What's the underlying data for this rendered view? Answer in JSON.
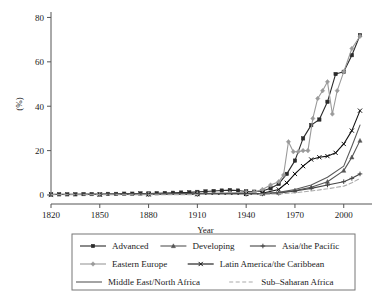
{
  "chart_data": {
    "type": "line",
    "title": "",
    "subtitle": "",
    "xlabel": "Year",
    "ylabel": "(%)",
    "xlim": [
      1820,
      2010
    ],
    "ylim": [
      0,
      82
    ],
    "grid": false,
    "legend_position": "bottom",
    "xticks": [
      1820,
      1850,
      1880,
      1910,
      1940,
      1970,
      2000
    ],
    "xticklabels": [
      "1820",
      "1850",
      "1880",
      "1910",
      "1940",
      "1970",
      "2000"
    ],
    "yticks": [
      0,
      20,
      40,
      60,
      80
    ],
    "yticklabels": [
      "0",
      "20",
      "40",
      "60",
      "80"
    ],
    "series": [
      {
        "name": "Advanced",
        "marker": "square",
        "color": "#2b2b2b",
        "dash": "none",
        "x": [
          1820,
          1825,
          1830,
          1835,
          1840,
          1845,
          1850,
          1855,
          1860,
          1865,
          1870,
          1875,
          1880,
          1885,
          1890,
          1895,
          1900,
          1905,
          1910,
          1915,
          1920,
          1925,
          1930,
          1935,
          1940,
          1945,
          1950,
          1955,
          1960,
          1965,
          1970,
          1975,
          1980,
          1985,
          1990,
          1995,
          2000,
          2005,
          2010
        ],
        "values": [
          0.3,
          0.3,
          0.3,
          0.3,
          0.4,
          0.4,
          0.4,
          0.5,
          0.5,
          0.6,
          0.6,
          0.7,
          0.7,
          0.8,
          0.9,
          1.0,
          1.1,
          1.2,
          1.4,
          1.6,
          1.8,
          2.0,
          2.2,
          2.0,
          1.6,
          1.5,
          1.8,
          3.0,
          5.0,
          9.5,
          15.5,
          25.5,
          31.5,
          34.0,
          42.0,
          54.5,
          55.5,
          63.0,
          72.0
        ]
      },
      {
        "name": "Developing",
        "marker": "triangle",
        "color": "#555555",
        "dash": "none",
        "x": [
          1820,
          1850,
          1880,
          1910,
          1940,
          1950,
          1960,
          1970,
          1980,
          1990,
          2000,
          2005,
          2010
        ],
        "values": [
          0.2,
          0.2,
          0.3,
          0.4,
          0.5,
          0.6,
          1.0,
          2.0,
          3.5,
          6.0,
          11.0,
          17.0,
          24.5
        ]
      },
      {
        "name": "Asia/the Pacific",
        "marker": "plus",
        "color": "#444444",
        "dash": "none",
        "x": [
          1820,
          1850,
          1880,
          1910,
          1940,
          1950,
          1960,
          1970,
          1980,
          1990,
          2000,
          2005,
          2010
        ],
        "values": [
          0.2,
          0.2,
          0.2,
          0.3,
          0.4,
          0.5,
          0.8,
          1.8,
          3.0,
          4.5,
          6.0,
          7.5,
          9.5
        ]
      },
      {
        "name": "Eastern Europe",
        "marker": "diamond",
        "color": "#9a9a9a",
        "dash": "none",
        "x": [
          1820,
          1850,
          1880,
          1910,
          1930,
          1940,
          1945,
          1950,
          1955,
          1960,
          1963,
          1966,
          1969,
          1972,
          1975,
          1978,
          1981,
          1984,
          1987,
          1990,
          1993,
          1996,
          2000,
          2005,
          2010
        ],
        "values": [
          0.2,
          0.3,
          0.4,
          0.6,
          1.0,
          1.2,
          1.3,
          2.5,
          4.5,
          6.0,
          9.0,
          24.0,
          19.5,
          19.5,
          20.0,
          20.0,
          34.5,
          43.5,
          47.0,
          51.0,
          36.5,
          47.0,
          55.5,
          66.0,
          71.5
        ]
      },
      {
        "name": "Latin America/the Caribbean",
        "marker": "x",
        "color": "#111111",
        "dash": "none",
        "x": [
          1820,
          1850,
          1880,
          1910,
          1940,
          1950,
          1960,
          1965,
          1970,
          1975,
          1980,
          1985,
          1990,
          1995,
          2000,
          2005,
          2010
        ],
        "values": [
          0.2,
          0.2,
          0.3,
          0.4,
          0.5,
          0.8,
          2.5,
          5.5,
          9.5,
          13.0,
          16.0,
          17.0,
          17.5,
          19.0,
          23.0,
          29.0,
          38.0
        ]
      },
      {
        "name": "Middle East/North Africa",
        "marker": "none",
        "color": "#5a5a5a",
        "dash": "none",
        "x": [
          1820,
          1850,
          1880,
          1910,
          1940,
          1950,
          1960,
          1970,
          1980,
          1990,
          2000,
          2005,
          2010
        ],
        "values": [
          0.2,
          0.2,
          0.3,
          0.4,
          0.5,
          0.7,
          1.2,
          2.5,
          4.5,
          8.0,
          13.0,
          22.0,
          31.5
        ]
      },
      {
        "name": "Sub–Saharan Africa",
        "marker": "none",
        "color": "#aaaaaa",
        "dash": "dashed",
        "x": [
          1820,
          1850,
          1880,
          1910,
          1940,
          1950,
          1960,
          1970,
          1980,
          1990,
          2000,
          2005,
          2010
        ],
        "values": [
          0.1,
          0.1,
          0.1,
          0.2,
          0.2,
          0.3,
          0.5,
          1.0,
          1.8,
          2.8,
          4.0,
          5.5,
          7.5
        ]
      }
    ],
    "legend_rows": [
      [
        "Advanced",
        "Developing",
        "Asia/the Pacific"
      ],
      [
        "Eastern Europe",
        "Latin America/the Caribbean"
      ],
      [
        "Middle East/North Africa",
        "Sub–Saharan Africa"
      ]
    ]
  },
  "axes": {
    "x_title": "Year",
    "y_title": "(%)"
  }
}
